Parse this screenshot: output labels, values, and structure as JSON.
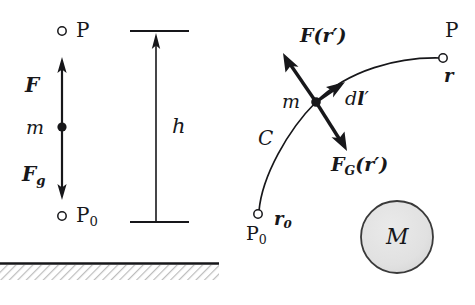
{
  "figure": {
    "width": 475,
    "height": 305,
    "background": "#ffffff",
    "ink_color": "#17171a",
    "sphere_fill": "#e0e0e0",
    "hatch_color": "#b9b9b9"
  },
  "left_panel": {
    "name": "uniform-gravity-panel",
    "point_top_label": "P",
    "point_bottom_label": "P",
    "point_bottom_sub": "0",
    "mass_label": "m",
    "force_applied_label": "F",
    "force_gravity_label": "F",
    "force_gravity_sub": "g",
    "height_label": "h",
    "ground_label": "ground-hatching"
  },
  "right_panel": {
    "name": "central-gravity-panel",
    "path_label": "C",
    "mass_label": "m",
    "point_start_label": "P",
    "point_start_sub": "0",
    "point_end_label": "P",
    "vector_start_label": "r",
    "vector_start_sub": "0",
    "vector_end_label": "r",
    "force_applied_label": "F",
    "force_applied_arg": "(r′)",
    "force_gravity_label": "F",
    "force_gravity_sub": "G",
    "force_gravity_arg": "(r′)",
    "displacement_d": "d",
    "displacement_l": "l",
    "displacement_prime": "′",
    "mass_sphere_label": "M"
  }
}
